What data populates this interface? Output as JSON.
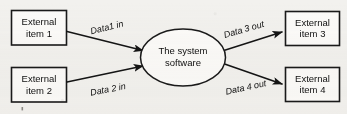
{
  "diagram": {
    "type": "context-data-flow-diagram",
    "canvas": {
      "width": 347,
      "height": 114
    },
    "colors": {
      "background": "#f2f1ee",
      "stroke": "#1a1a1a",
      "shape_fill": "#fbfaf8",
      "text": "#101010"
    },
    "process": {
      "id": "system-software",
      "shape": "ellipse",
      "line1": "The system",
      "line2": "software"
    },
    "entities": [
      {
        "id": "external-item-1",
        "shape": "rectangle",
        "line1": "External",
        "line2": "item 1",
        "side": "left"
      },
      {
        "id": "external-item-2",
        "shape": "rectangle",
        "line1": "External",
        "line2": "item 2",
        "side": "left"
      },
      {
        "id": "external-item-3",
        "shape": "rectangle",
        "line1": "External",
        "line2": "item 3",
        "side": "right"
      },
      {
        "id": "external-item-4",
        "shape": "rectangle",
        "line1": "External",
        "line2": "item 4",
        "side": "right"
      }
    ],
    "flows": [
      {
        "id": "flow-data1-in",
        "label": "Data1 in",
        "from": "external-item-1",
        "to": "system-software",
        "direction": "in"
      },
      {
        "id": "flow-data2-in",
        "label": "Data 2 in",
        "from": "external-item-2",
        "to": "system-software",
        "direction": "in"
      },
      {
        "id": "flow-data3-out",
        "label": "Data 3 out",
        "from": "system-software",
        "to": "external-item-3",
        "direction": "out"
      },
      {
        "id": "flow-data4-out",
        "label": "Data 4 out",
        "from": "system-software",
        "to": "external-item-4",
        "direction": "out"
      }
    ]
  }
}
